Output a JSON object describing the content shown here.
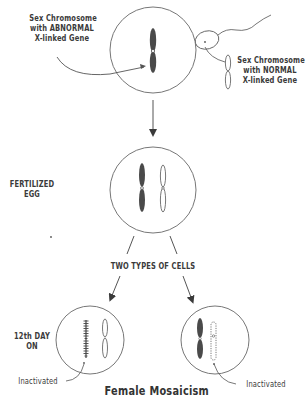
{
  "diagram": {
    "title": "Female Mosaicism",
    "labels": {
      "abnormal_chromosome": [
        "Sex Chromosome",
        "with ABNORMAL",
        "X-linked Gene"
      ],
      "normal_chromosome": [
        "Sex Chromosome",
        "with NORMAL",
        "X-linked Gene"
      ],
      "fertilized_egg": [
        "FERTILIZED",
        "EGG"
      ],
      "two_types": "TWO TYPES OF CELLS",
      "day_12": [
        "12th DAY",
        "ON"
      ],
      "inactivated_left": "Inactivated",
      "inactivated_right": "Inactivated"
    },
    "nodes": [
      {
        "id": "egg",
        "label": "Egg with abnormal X chromosome",
        "shape": "circle"
      },
      {
        "id": "sperm",
        "label": "Sperm with normal X chromosome",
        "shape": "ellipse-with-tail"
      },
      {
        "id": "fertilized",
        "label": "Fertilized egg with two X chromosomes",
        "shape": "circle"
      },
      {
        "id": "cell_a",
        "label": "Cell with abnormal X inactivated",
        "shape": "circle"
      },
      {
        "id": "cell_b",
        "label": "Cell with normal X inactivated",
        "shape": "circle"
      }
    ],
    "edges": [
      {
        "from": "egg",
        "to": "fertilized"
      },
      {
        "from": "fertilized",
        "to": "cell_a"
      },
      {
        "from": "fertilized",
        "to": "cell_b"
      }
    ],
    "colors": {
      "ink": "#3a3a3a",
      "line": "#6a6a6a",
      "chromosome_dark": "#4a4a4a",
      "background": "#ffffff"
    }
  }
}
